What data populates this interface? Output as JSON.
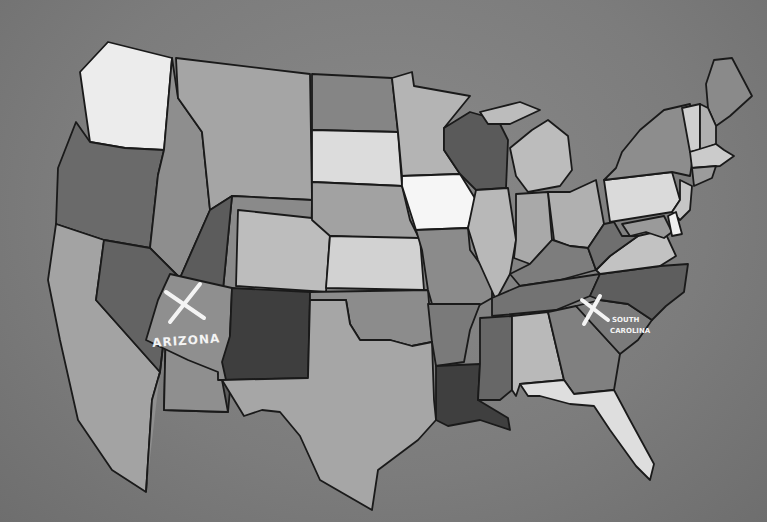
{
  "map": {
    "title": "Contiguous United States (hand-drawn)",
    "background": "#7f7f7f",
    "stroke": "#1a1a1a",
    "annotations": [
      {
        "state": "Arizona",
        "label": "ARIZONA",
        "mark": "X"
      },
      {
        "state": "South Carolina",
        "label_line1": "SOUTH",
        "label_line2": "CAROLINA",
        "mark": "X"
      }
    ],
    "states": [
      {
        "name": "Washington",
        "fill": "#ececec"
      },
      {
        "name": "Oregon",
        "fill": "#6a6a6a"
      },
      {
        "name": "California",
        "fill": "#a3a3a3"
      },
      {
        "name": "Idaho",
        "fill": "#8e8e8e"
      },
      {
        "name": "Nevada",
        "fill": "#636363"
      },
      {
        "name": "Montana",
        "fill": "#a5a5a5"
      },
      {
        "name": "Wyoming",
        "fill": "#8a8a8a"
      },
      {
        "name": "Utah",
        "fill": "#5c5c5c"
      },
      {
        "name": "Arizona",
        "fill": "#8f8f8f"
      },
      {
        "name": "Colorado",
        "fill": "#bdbdbd"
      },
      {
        "name": "New Mexico",
        "fill": "#3e3e3e"
      },
      {
        "name": "North Dakota",
        "fill": "#858585"
      },
      {
        "name": "South Dakota",
        "fill": "#dcdcdc"
      },
      {
        "name": "Nebraska",
        "fill": "#a2a2a2"
      },
      {
        "name": "Kansas",
        "fill": "#d2d2d2"
      },
      {
        "name": "Oklahoma",
        "fill": "#8c8c8c"
      },
      {
        "name": "Texas",
        "fill": "#a6a6a6"
      },
      {
        "name": "Minnesota",
        "fill": "#b4b4b4"
      },
      {
        "name": "Iowa",
        "fill": "#f6f6f6"
      },
      {
        "name": "Missouri",
        "fill": "#8b8b8b"
      },
      {
        "name": "Arkansas",
        "fill": "#7a7a7a"
      },
      {
        "name": "Louisiana",
        "fill": "#3f3f3f"
      },
      {
        "name": "Wisconsin",
        "fill": "#5a5a5a"
      },
      {
        "name": "Illinois",
        "fill": "#b8b8b8"
      },
      {
        "name": "Michigan",
        "fill": "#bcbcbc"
      },
      {
        "name": "Indiana",
        "fill": "#a9a9a9"
      },
      {
        "name": "Ohio",
        "fill": "#b0b0b0"
      },
      {
        "name": "Kentucky",
        "fill": "#7d7d7d"
      },
      {
        "name": "Tennessee",
        "fill": "#737373"
      },
      {
        "name": "Mississippi",
        "fill": "#676767"
      },
      {
        "name": "Alabama",
        "fill": "#b9b9b9"
      },
      {
        "name": "Georgia",
        "fill": "#808080"
      },
      {
        "name": "Florida",
        "fill": "#dedede"
      },
      {
        "name": "South Carolina",
        "fill": "#7b7b7b"
      },
      {
        "name": "North Carolina",
        "fill": "#5e5e5e"
      },
      {
        "name": "Virginia",
        "fill": "#c2c2c2"
      },
      {
        "name": "West Virginia",
        "fill": "#6f6f6f"
      },
      {
        "name": "Pennsylvania",
        "fill": "#dadada"
      },
      {
        "name": "New York",
        "fill": "#8d8d8d"
      },
      {
        "name": "Maine",
        "fill": "#8a8a8a"
      },
      {
        "name": "Vermont",
        "fill": "#cfcfcf"
      },
      {
        "name": "New Hampshire",
        "fill": "#b0b0b0"
      },
      {
        "name": "Massachusetts",
        "fill": "#cbcbcb"
      },
      {
        "name": "Connecticut",
        "fill": "#9c9c9c"
      },
      {
        "name": "New Jersey",
        "fill": "#c6c6c6"
      },
      {
        "name": "Delaware",
        "fill": "#f0f0f0"
      },
      {
        "name": "Maryland",
        "fill": "#9a9a9a"
      }
    ]
  }
}
